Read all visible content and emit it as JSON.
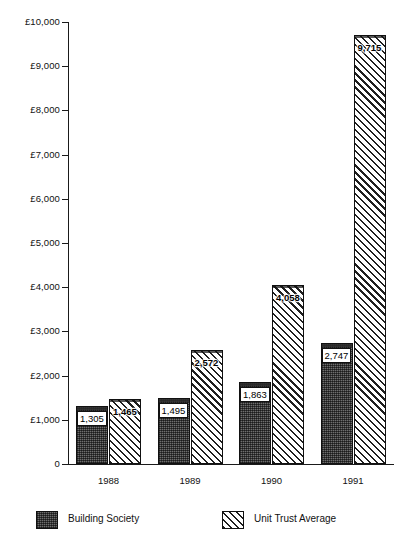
{
  "chart_data": {
    "type": "bar",
    "title": "",
    "subtitle": "",
    "xlabel": "",
    "ylabel": "",
    "categories": [
      "1988",
      "1989",
      "1990",
      "1991"
    ],
    "series": [
      {
        "name": "Building Society",
        "values": [
          1305,
          1495,
          1863,
          2747
        ],
        "value_labels": [
          "1,305",
          "1,495",
          "1,863",
          "2,747"
        ],
        "fill": "stipple-checker",
        "color": "#6e6e6e"
      },
      {
        "name": "Unit Trust Average",
        "values": [
          1465,
          2572,
          4058,
          9715
        ],
        "value_labels": [
          "1,465",
          "2,572",
          "4,058",
          "9,715"
        ],
        "fill": "diagonal-hatch",
        "color": "#1f1f1f"
      }
    ],
    "ylim": [
      0,
      10000
    ],
    "ytick_values": [
      0,
      1000,
      2000,
      3000,
      4000,
      5000,
      6000,
      7000,
      8000,
      9000,
      10000
    ],
    "ytick_labels": [
      "0",
      "£1,000",
      "£2,000",
      "£3,000",
      "£4,000",
      "£5,000",
      "£6,000",
      "£7,000",
      "£8,000",
      "£9,000",
      "£10,000"
    ],
    "grid": false,
    "legend_position": "bottom",
    "currency_symbol": "£"
  },
  "legend": {
    "items": [
      {
        "label": "Building Society"
      },
      {
        "label": "Unit Trust Average"
      }
    ]
  }
}
